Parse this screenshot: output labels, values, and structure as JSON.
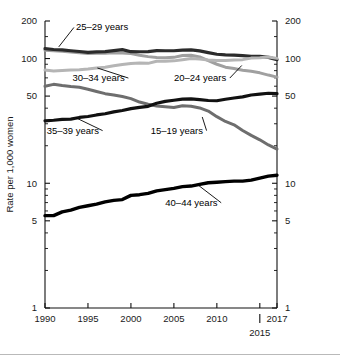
{
  "chart_data": {
    "type": "line",
    "title": "",
    "subtitle": "",
    "xlabel": "",
    "ylabel": "Rate per 1,000 women",
    "yscale": "log",
    "ylim": [
      1,
      200
    ],
    "xlim": [
      1990,
      2017
    ],
    "grid": false,
    "legend_position": "inline-annotations",
    "ytick_labels": [
      "200",
      "100",
      "50",
      "10",
      "5",
      "1"
    ],
    "ytick_values": [
      200,
      100,
      50,
      10,
      5,
      1
    ],
    "yminor_values": [
      150,
      90,
      80,
      70,
      60,
      40,
      30,
      20,
      9,
      8,
      7,
      6,
      4,
      3,
      2
    ],
    "xtick_labels": [
      "1990",
      "1995",
      "2000",
      "2005",
      "2010",
      "2017"
    ],
    "xtick_values": [
      1990,
      1995,
      2000,
      2005,
      2010,
      2017
    ],
    "x_extra_tick_label": "2015",
    "x_extra_tick_value": 2015,
    "x": [
      1990,
      1991,
      1992,
      1993,
      1994,
      1995,
      1996,
      1997,
      1998,
      1999,
      2000,
      2001,
      2002,
      2003,
      2004,
      2005,
      2006,
      2007,
      2008,
      2009,
      2010,
      2011,
      2012,
      2013,
      2014,
      2015,
      2016,
      2017
    ],
    "series": [
      {
        "name": "15-19 years",
        "label": "15–19 years",
        "color": "#6e6e6e",
        "linewidth": 3.0,
        "values": [
          59.9,
          62.1,
          60.7,
          59.6,
          58.9,
          56.8,
          54.4,
          52.3,
          51.1,
          49.6,
          47.7,
          44.8,
          43.0,
          41.6,
          41.1,
          40.5,
          41.9,
          41.5,
          40.2,
          37.9,
          34.2,
          31.3,
          29.4,
          26.5,
          24.2,
          22.3,
          20.3,
          18.8
        ]
      },
      {
        "name": "20-24 years",
        "label": "20–24 years",
        "color": "#a0a0a0",
        "linewidth": 3.0,
        "values": [
          116.5,
          115.7,
          114.6,
          112.6,
          111.1,
          109.8,
          110.4,
          110.4,
          111.2,
          110.9,
          109.7,
          106.2,
          103.6,
          102.1,
          101.7,
          102.2,
          105.9,
          106.3,
          103.0,
          96.2,
          90.0,
          85.3,
          83.1,
          80.7,
          79.0,
          76.8,
          73.7,
          71.0
        ]
      },
      {
        "name": "25-29 years",
        "label": "25–29 years",
        "color": "#2b2b2b",
        "linewidth": 3.2,
        "values": [
          120.2,
          118.2,
          117.4,
          115.5,
          113.9,
          112.2,
          113.1,
          113.8,
          115.9,
          117.8,
          113.5,
          113.4,
          113.6,
          115.6,
          115.5,
          115.5,
          116.8,
          117.5,
          115.1,
          111.5,
          108.3,
          107.2,
          106.5,
          105.5,
          104.3,
          104.3,
          102.1,
          98.0
        ]
      },
      {
        "name": "30-34 years",
        "label": "30–34 years",
        "color": "#b5b5b5",
        "linewidth": 3.0,
        "values": [
          80.8,
          79.5,
          80.2,
          80.8,
          81.5,
          82.5,
          83.9,
          85.3,
          87.4,
          89.6,
          91.2,
          91.9,
          91.5,
          95.1,
          95.3,
          95.8,
          97.7,
          99.9,
          99.3,
          97.5,
          96.5,
          96.5,
          97.3,
          98.0,
          100.8,
          101.5,
          102.7,
          100.3
        ]
      },
      {
        "name": "35-39 years",
        "label": "35–39 years",
        "color": "#111111",
        "linewidth": 3.2,
        "values": [
          31.7,
          32.0,
          32.5,
          32.7,
          33.7,
          34.3,
          35.3,
          36.1,
          37.4,
          38.3,
          39.7,
          40.6,
          41.4,
          43.8,
          45.4,
          46.3,
          47.3,
          47.5,
          46.9,
          46.1,
          45.9,
          47.2,
          48.3,
          49.3,
          51.0,
          51.8,
          52.7,
          52.3
        ]
      },
      {
        "name": "40-44 years",
        "label": "40–44 years",
        "color": "#000000",
        "linewidth": 3.4,
        "values": [
          5.5,
          5.5,
          5.9,
          6.1,
          6.4,
          6.6,
          6.8,
          7.1,
          7.3,
          7.4,
          8.0,
          8.1,
          8.3,
          8.7,
          8.9,
          9.1,
          9.4,
          9.5,
          9.8,
          10.1,
          10.2,
          10.3,
          10.4,
          10.4,
          10.6,
          11.0,
          11.4,
          11.6
        ]
      }
    ],
    "annotations": [
      {
        "text": "25–29 years",
        "x_year": 1993.6,
        "y_value": 168,
        "leader_to_x": 1991.6,
        "leader_to_y": 124,
        "anchor": "start"
      },
      {
        "text": "30–34 years",
        "x_year": 1993.2,
        "y_value": 66,
        "leader_to_x": 1996.1,
        "leader_to_y": 84,
        "anchor": "start"
      },
      {
        "text": "20–24 years",
        "x_year": 2005.0,
        "y_value": 66,
        "leader_to_x": 2012.9,
        "leader_to_y": 88,
        "anchor": "start"
      },
      {
        "text": "35–39 years",
        "x_year": 1990.2,
        "y_value": 25,
        "leader_to_x": 1993.6,
        "leader_to_y": 33.5,
        "anchor": "start"
      },
      {
        "text": "15–19 years",
        "x_year": 2002.3,
        "y_value": 25,
        "leader_to_x": 2008.3,
        "leader_to_y": 34,
        "anchor": "start"
      },
      {
        "text": "40–44 years",
        "x_year": 2004.0,
        "y_value": 6.6,
        "leader_to_x": 2007.8,
        "leader_to_y": 9.7,
        "anchor": "start"
      }
    ]
  }
}
